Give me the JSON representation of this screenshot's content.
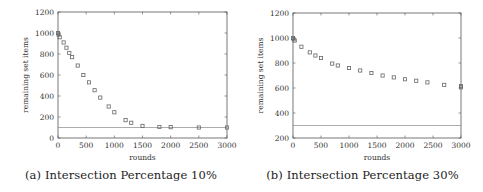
{
  "chart_data": [
    {
      "type": "scatter",
      "id": "a",
      "caption": "(a) Intersection Percentage 10%",
      "xlabel": "rounds",
      "ylabel": "remaining set items",
      "xlim": [
        0,
        3000
      ],
      "ylim": [
        0,
        1200
      ],
      "xticks": [
        0,
        500,
        1000,
        1500,
        2000,
        2500,
        3000
      ],
      "yticks": [
        0,
        200,
        400,
        600,
        800,
        1000,
        1200
      ],
      "grid": false,
      "threshold": 100,
      "series": [
        {
          "name": "remaining set items",
          "marker": "square",
          "x": [
            0,
            10,
            30,
            100,
            150,
            200,
            250,
            350,
            450,
            550,
            650,
            750,
            900,
            1000,
            1200,
            1300,
            1500,
            1800,
            2000,
            2500,
            3000
          ],
          "y": [
            1000,
            985,
            960,
            910,
            860,
            810,
            770,
            690,
            600,
            530,
            455,
            385,
            300,
            245,
            170,
            145,
            115,
            105,
            103,
            100,
            100
          ]
        }
      ]
    },
    {
      "type": "scatter",
      "id": "b",
      "caption": "(b) Intersection Percentage 30%",
      "xlabel": "rounds",
      "ylabel": "remaining set items",
      "xlim": [
        0,
        3000
      ],
      "ylim": [
        200,
        1200
      ],
      "xticks": [
        0,
        500,
        1000,
        1500,
        2000,
        2500,
        3000
      ],
      "yticks": [
        200,
        400,
        600,
        800,
        1000,
        1200
      ],
      "grid": false,
      "threshold": 300,
      "series": [
        {
          "name": "remaining set items",
          "marker": "square",
          "x": [
            0,
            10,
            30,
            150,
            300,
            400,
            500,
            700,
            800,
            1000,
            1200,
            1400,
            1600,
            1800,
            2000,
            2200,
            2400,
            2700,
            3000,
            3000
          ],
          "y": [
            1000,
            990,
            980,
            930,
            885,
            860,
            840,
            795,
            780,
            760,
            740,
            720,
            700,
            685,
            670,
            658,
            645,
            625,
            615,
            605
          ]
        }
      ]
    }
  ],
  "layout": {
    "a": {
      "left": 58,
      "right": 227,
      "top": 12,
      "bottom": 138
    },
    "b": {
      "left": 51,
      "right": 219,
      "top": 13,
      "bottom": 138
    }
  },
  "colors": {
    "axis": "#555555",
    "marker": "#666666",
    "threshold_line": "#888888",
    "text": "#333333"
  }
}
